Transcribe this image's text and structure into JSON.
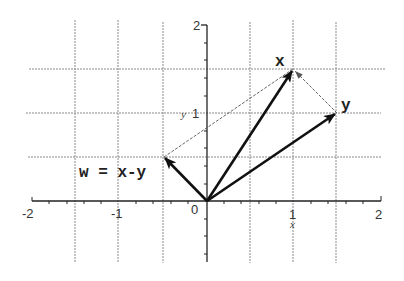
{
  "diagram": {
    "type": "vector-plot",
    "axes": {
      "x_label": "x",
      "y_label": "y",
      "x_range": [
        -2,
        2
      ],
      "y_range": [
        -0.7,
        2
      ],
      "x_ticks": [
        "-2",
        "-1",
        "0",
        "1",
        "2"
      ],
      "y_ticks": [
        "1",
        "2"
      ],
      "origin_label": "0"
    },
    "grid": {
      "vertical_at": [
        -1.5,
        -1,
        -0.5,
        0.5,
        1,
        1.5
      ],
      "horizontal_at": [
        0.5,
        1,
        1.5
      ],
      "style": "dotted"
    },
    "vectors": [
      {
        "name": "x",
        "label": "x",
        "from": [
          0,
          0
        ],
        "to": [
          1,
          1.5
        ]
      },
      {
        "name": "y",
        "label": "y",
        "from": [
          0,
          0
        ],
        "to": [
          1.5,
          1
        ]
      },
      {
        "name": "w",
        "label": "w = x-y",
        "from": [
          0,
          0
        ],
        "to": [
          -0.5,
          0.5
        ]
      }
    ],
    "dashed_lines": [
      {
        "from": [
          -0.5,
          0.5
        ],
        "to": [
          1,
          1.5
        ]
      },
      {
        "from": [
          1.5,
          1
        ],
        "to": [
          1,
          1.5
        ],
        "arrow": true
      }
    ],
    "colors": {
      "background": "#ffffff",
      "vectors": "#111111",
      "grid": "#888888",
      "axes": "#222222"
    }
  }
}
